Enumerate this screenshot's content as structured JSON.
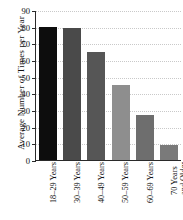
{
  "chart_data": {
    "type": "bar",
    "title": "",
    "subtitle": "",
    "xlabel": "",
    "ylabel": "Average Number of Times per Year",
    "categories": [
      "18–29 Years",
      "30–39 Years",
      "40–49 Years",
      "50–59 Years",
      "60–69 Years",
      "70 Years and Older"
    ],
    "category_lines": [
      [
        "18–29 Years"
      ],
      [
        "30–39 Years"
      ],
      [
        "40–49 Years"
      ],
      [
        "50–59 Years"
      ],
      [
        "60–69 Years"
      ],
      [
        "70 Years",
        "and Older"
      ]
    ],
    "values": [
      80.5,
      79.5,
      65,
      45.5,
      27,
      9
    ],
    "bar_colors": [
      "#0d0d0d",
      "#4a4a4a",
      "#565656",
      "#8e8e8e",
      "#6e6e6e",
      "#7a7a7a"
    ],
    "ylim": [
      0,
      90
    ],
    "yticks": [
      0,
      10,
      20,
      30,
      40,
      50,
      60,
      70,
      80,
      90
    ],
    "ytick_labels": [
      "0",
      "10",
      "20",
      "30",
      "40",
      "50",
      "60",
      "70",
      "80",
      "90"
    ],
    "grid": true,
    "grid_axis": "y",
    "legend": false,
    "legend_position": "none",
    "axis_color": "#2a2a2a",
    "grid_color": "#c9c9c9",
    "background": "#ffffff"
  }
}
